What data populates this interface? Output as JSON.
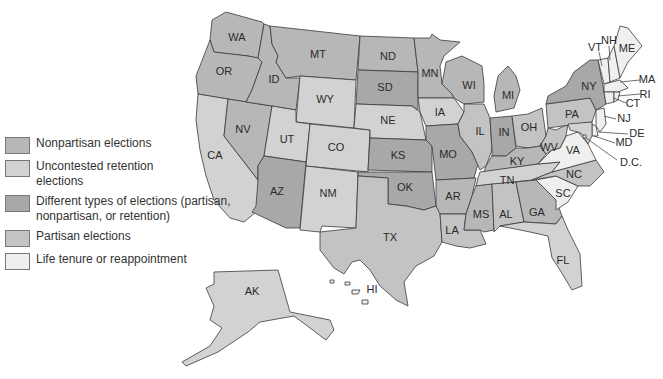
{
  "colors": {
    "nonpartisan": "#b7b7b7",
    "retention": "#d2d2d2",
    "different": "#a8a8a8",
    "partisan": "#c3c3c3",
    "life": "#efefef",
    "border": "#3a3a3a"
  },
  "legend": {
    "items": [
      {
        "key": "nonpartisan",
        "label": "Nonpartisan elections"
      },
      {
        "key": "retention",
        "label": "Uncontested retention elections"
      },
      {
        "key": "different",
        "label": "Different types of elections (partisan, nonpartisan, or retention)"
      },
      {
        "key": "partisan",
        "label": "Partisan elections"
      },
      {
        "key": "life",
        "label": "Life tenure or reappointment"
      }
    ]
  },
  "states": {
    "WA": "nonpartisan",
    "OR": "nonpartisan",
    "CA": "retention",
    "NV": "nonpartisan",
    "ID": "nonpartisan",
    "MT": "nonpartisan",
    "WY": "retention",
    "UT": "retention",
    "CO": "retention",
    "AZ": "different",
    "NM": "retention",
    "ND": "nonpartisan",
    "SD": "different",
    "NE": "retention",
    "KS": "different",
    "OK": "different",
    "TX": "partisan",
    "MN": "nonpartisan",
    "IA": "retention",
    "MO": "different",
    "AR": "nonpartisan",
    "LA": "partisan",
    "WI": "nonpartisan",
    "IL": "partisan",
    "MI": "nonpartisan",
    "IN": "different",
    "OH": "partisan",
    "KY": "nonpartisan",
    "TN": "retention",
    "MS": "nonpartisan",
    "AL": "partisan",
    "GA": "nonpartisan",
    "FL": "retention",
    "SC": "life",
    "NC": "partisan",
    "VA": "life",
    "WV": "partisan",
    "PA": "partisan",
    "NY": "different",
    "VT": "life",
    "NH": "life",
    "ME": "life",
    "MA": "life",
    "RI": "life",
    "CT": "life",
    "NJ": "life",
    "DE": "life",
    "MD": "retention",
    "DC": "life",
    "AK": "retention",
    "HI": "life"
  },
  "labels": {
    "WA": "WA",
    "OR": "OR",
    "CA": "CA",
    "NV": "NV",
    "ID": "ID",
    "MT": "MT",
    "WY": "WY",
    "UT": "UT",
    "CO": "CO",
    "AZ": "AZ",
    "NM": "NM",
    "ND": "ND",
    "SD": "SD",
    "NE": "NE",
    "KS": "KS",
    "OK": "OK",
    "TX": "TX",
    "MN": "MN",
    "IA": "IA",
    "MO": "MO",
    "AR": "AR",
    "LA": "LA",
    "WI": "WI",
    "IL": "IL",
    "MI": "MI",
    "IN": "IN",
    "OH": "OH",
    "KY": "KY",
    "TN": "TN",
    "MS": "MS",
    "AL": "AL",
    "GA": "GA",
    "FL": "FL",
    "SC": "SC",
    "NC": "NC",
    "VA": "VA",
    "WV": "WV",
    "PA": "PA",
    "NY": "NY",
    "VT": "VT",
    "NH": "NH",
    "ME": "ME",
    "MA": "MA",
    "RI": "RI",
    "CT": "CT",
    "NJ": "NJ",
    "DE": "DE",
    "MD": "MD",
    "DC": "D.C.",
    "AK": "AK",
    "HI": "HI"
  }
}
